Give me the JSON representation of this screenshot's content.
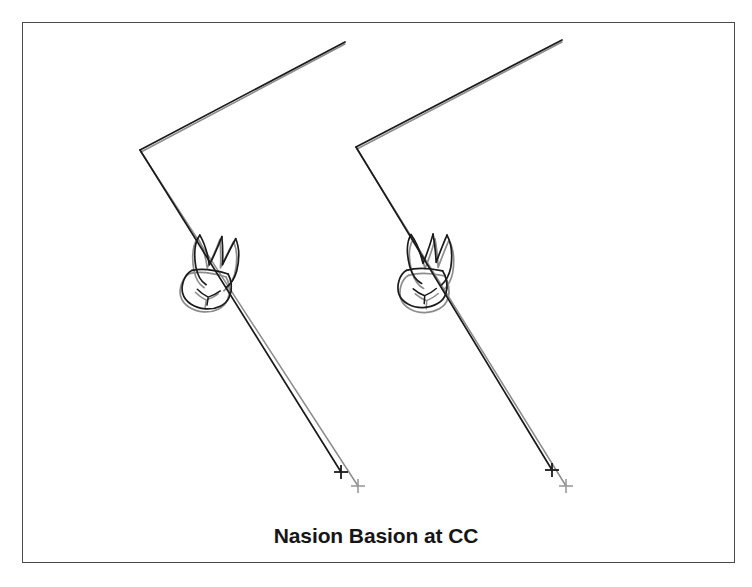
{
  "figure": {
    "caption": "Nasion Basion at CC",
    "title": "Nasion Basion at CC",
    "kind": "cephalometric-superimposition-tracing",
    "frame": {
      "border_color": "#4a4a4a",
      "background_color": "#ffffff",
      "x": 22,
      "y": 22,
      "width": 713,
      "height": 541
    },
    "colors": {
      "pre_treatment_trace": "#1a1a1a",
      "post_treatment_trace": "#8c8c8c",
      "caption_text": "#161616",
      "page_background": "#ffffff"
    },
    "legend_note": "black = first tracing, gray = superimposed second tracing",
    "panels": [
      {
        "name": "left-panel",
        "label": "left-superimposition",
        "registration_point": "CC",
        "reference_line": "Nasion-Basion",
        "black_trace": {
          "nasion_basion_apex": [
            140,
            150
          ],
          "nasion_end": [
            345,
            42
          ],
          "basion_axis_end": [
            341,
            472
          ],
          "molar_center": [
            215,
            280
          ],
          "cross_marker": [
            341,
            472
          ]
        },
        "gray_trace": {
          "nasion_basion_apex": [
            141,
            152
          ],
          "nasion_end": [
            345,
            44
          ],
          "basion_axis_end": [
            358,
            486
          ],
          "molar_center": [
            213,
            283
          ],
          "cross_marker": [
            358,
            486
          ]
        }
      },
      {
        "name": "right-panel",
        "label": "right-superimposition",
        "registration_point": "CC",
        "reference_line": "Nasion-Basion",
        "black_trace": {
          "nasion_basion_apex": [
            356,
            147
          ],
          "nasion_end": [
            562,
            40
          ],
          "basion_axis_end": [
            552,
            470
          ],
          "molar_center": [
            430,
            278
          ],
          "cross_marker": [
            552,
            470
          ]
        },
        "gray_trace": {
          "nasion_basion_apex": [
            357,
            149
          ],
          "nasion_end": [
            562,
            42
          ],
          "basion_axis_end": [
            566,
            486
          ],
          "molar_center": [
            432,
            283
          ],
          "cross_marker": [
            566,
            486
          ]
        }
      }
    ],
    "markers": {
      "cross_size": 13,
      "count": 4,
      "description": "incisor/condyle landmark crosses at the end of each facial axis"
    },
    "anatomy": {
      "structures": [
        "nasion-basion line",
        "facial axis",
        "maxillary first molar",
        "molar roots",
        "molar crown",
        "occlusal contour"
      ]
    }
  }
}
